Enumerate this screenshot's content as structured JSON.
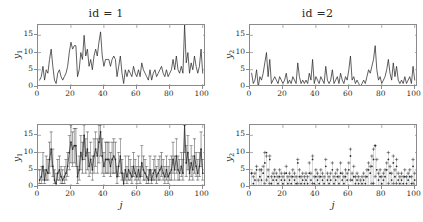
{
  "figure": {
    "width": 423,
    "height": 222,
    "background": "#ffffff",
    "axis_color": "#8a8a8a",
    "line_color": "#2b2b2b",
    "marker_color": "#2b2b2b"
  },
  "chart_data": [
    {
      "id": "top-left",
      "type": "line",
      "title": "id = 1",
      "xlabel": "",
      "ylabel": "y_1",
      "ylabel_base": "y",
      "ylabel_sub": "1",
      "xlim": [
        0,
        102
      ],
      "ylim": [
        0,
        18
      ],
      "xticks": [
        0,
        20,
        40,
        60,
        80,
        100
      ],
      "yticks": [
        0,
        5,
        10,
        15
      ],
      "grid": false,
      "legend": "none",
      "x": [
        1,
        2,
        3,
        4,
        5,
        6,
        7,
        8,
        9,
        10,
        11,
        12,
        13,
        14,
        15,
        16,
        17,
        18,
        19,
        20,
        21,
        22,
        23,
        24,
        25,
        26,
        27,
        28,
        29,
        30,
        31,
        32,
        33,
        34,
        35,
        36,
        37,
        38,
        39,
        40,
        41,
        42,
        43,
        44,
        45,
        46,
        47,
        48,
        49,
        50,
        51,
        52,
        53,
        54,
        55,
        56,
        57,
        58,
        59,
        60,
        61,
        62,
        63,
        64,
        65,
        66,
        67,
        68,
        69,
        70,
        71,
        72,
        73,
        74,
        75,
        76,
        77,
        78,
        79,
        80,
        81,
        82,
        83,
        84,
        85,
        86,
        87,
        88,
        89,
        90,
        91,
        92,
        93,
        94,
        95,
        96,
        97,
        98,
        99,
        100
      ],
      "values": [
        2,
        3,
        6,
        2,
        5,
        4,
        8,
        11,
        6,
        2,
        1,
        4,
        5,
        3,
        2,
        3,
        4,
        6,
        10,
        13,
        11,
        12,
        12,
        3,
        5,
        10,
        8,
        15,
        9,
        11,
        6,
        8,
        5,
        9,
        11,
        9,
        13,
        16,
        9,
        6,
        8,
        8,
        8,
        6,
        8,
        9,
        8,
        3,
        6,
        9,
        4,
        1,
        5,
        3,
        5,
        4,
        3,
        6,
        4,
        3,
        5,
        3,
        7,
        5,
        4,
        3,
        2,
        5,
        2,
        4,
        5,
        3,
        4,
        5,
        6,
        4,
        3,
        5,
        3,
        4,
        5,
        8,
        5,
        9,
        5,
        4,
        6,
        4,
        18,
        7,
        10,
        4,
        7,
        5,
        9,
        6,
        4,
        6,
        11,
        4
      ]
    },
    {
      "id": "top-right",
      "type": "line",
      "title": "id =2",
      "xlabel": "",
      "ylabel": "y_2",
      "ylabel_base": "y",
      "ylabel_sub": "2",
      "xlim": [
        0,
        102
      ],
      "ylim": [
        0,
        18
      ],
      "xticks": [
        0,
        20,
        40,
        60,
        80,
        100
      ],
      "yticks": [
        0,
        5,
        10,
        15
      ],
      "grid": false,
      "legend": "none",
      "x": [
        1,
        2,
        3,
        4,
        5,
        6,
        7,
        8,
        9,
        10,
        11,
        12,
        13,
        14,
        15,
        16,
        17,
        18,
        19,
        20,
        21,
        22,
        23,
        24,
        25,
        26,
        27,
        28,
        29,
        30,
        31,
        32,
        33,
        34,
        35,
        36,
        37,
        38,
        39,
        40,
        41,
        42,
        43,
        44,
        45,
        46,
        47,
        48,
        49,
        50,
        51,
        52,
        53,
        54,
        55,
        56,
        57,
        58,
        59,
        60,
        61,
        62,
        63,
        64,
        65,
        66,
        67,
        68,
        69,
        70,
        71,
        72,
        73,
        74,
        75,
        76,
        77,
        78,
        79,
        80,
        81,
        82,
        83,
        84,
        85,
        86,
        87,
        88,
        89,
        90,
        91,
        92,
        93,
        94,
        95,
        96,
        97,
        98,
        99,
        100
      ],
      "values": [
        4,
        1,
        2,
        5,
        0,
        3,
        2,
        4,
        7,
        10,
        3,
        8,
        1,
        2,
        3,
        2,
        1,
        3,
        2,
        1,
        2,
        4,
        1,
        2,
        1,
        3,
        2,
        1,
        7,
        3,
        1,
        2,
        1,
        2,
        1,
        4,
        2,
        8,
        1,
        3,
        2,
        1,
        3,
        2,
        1,
        6,
        2,
        1,
        2,
        5,
        1,
        2,
        3,
        1,
        4,
        2,
        1,
        3,
        2,
        5,
        9,
        2,
        3,
        1,
        2,
        1,
        0,
        1,
        2,
        1,
        3,
        5,
        4,
        6,
        8,
        12,
        5,
        2,
        3,
        1,
        2,
        3,
        5,
        8,
        4,
        2,
        7,
        3,
        6,
        2,
        1,
        2,
        1,
        3,
        1,
        2,
        3,
        1,
        6,
        2
      ]
    },
    {
      "id": "bottom-left",
      "type": "line",
      "title": "",
      "xlabel": "j",
      "ylabel": "y_1",
      "ylabel_base": "y",
      "ylabel_sub": "1",
      "xlim": [
        0,
        102
      ],
      "ylim": [
        0,
        18
      ],
      "xticks": [
        0,
        20,
        40,
        60,
        80,
        100
      ],
      "yticks": [
        0,
        5,
        10,
        15
      ],
      "grid": false,
      "legend": "none",
      "description": "observed counts with prediction interval whiskers",
      "x": [
        1,
        2,
        3,
        4,
        5,
        6,
        7,
        8,
        9,
        10,
        11,
        12,
        13,
        14,
        15,
        16,
        17,
        18,
        19,
        20,
        21,
        22,
        23,
        24,
        25,
        26,
        27,
        28,
        29,
        30,
        31,
        32,
        33,
        34,
        35,
        36,
        37,
        38,
        39,
        40,
        41,
        42,
        43,
        44,
        45,
        46,
        47,
        48,
        49,
        50,
        51,
        52,
        53,
        54,
        55,
        56,
        57,
        58,
        59,
        60,
        61,
        62,
        63,
        64,
        65,
        66,
        67,
        68,
        69,
        70,
        71,
        72,
        73,
        74,
        75,
        76,
        77,
        78,
        79,
        80,
        81,
        82,
        83,
        84,
        85,
        86,
        87,
        88,
        89,
        90,
        91,
        92,
        93,
        94,
        95,
        96,
        97,
        98,
        99,
        100
      ],
      "values": [
        2,
        3,
        6,
        2,
        5,
        4,
        8,
        11,
        6,
        2,
        1,
        4,
        5,
        3,
        2,
        3,
        4,
        6,
        10,
        13,
        11,
        12,
        12,
        3,
        5,
        10,
        8,
        15,
        9,
        11,
        6,
        8,
        5,
        9,
        11,
        9,
        13,
        16,
        9,
        6,
        8,
        8,
        8,
        6,
        8,
        9,
        8,
        3,
        6,
        9,
        4,
        1,
        5,
        3,
        5,
        4,
        3,
        6,
        4,
        3,
        5,
        3,
        7,
        5,
        4,
        3,
        2,
        5,
        2,
        4,
        5,
        3,
        4,
        5,
        6,
        4,
        3,
        5,
        3,
        4,
        5,
        8,
        5,
        9,
        5,
        4,
        6,
        4,
        18,
        7,
        10,
        4,
        7,
        5,
        9,
        6,
        4,
        6,
        11,
        4
      ],
      "err_lo": [
        1,
        1,
        2,
        1,
        2,
        2,
        4,
        6,
        3,
        1,
        0,
        2,
        2,
        1,
        1,
        1,
        2,
        3,
        5,
        7,
        6,
        7,
        6,
        1,
        2,
        5,
        4,
        8,
        4,
        5,
        3,
        4,
        2,
        4,
        6,
        4,
        7,
        9,
        4,
        3,
        4,
        4,
        4,
        3,
        4,
        4,
        4,
        1,
        3,
        4,
        2,
        0,
        2,
        1,
        2,
        2,
        1,
        3,
        2,
        1,
        2,
        1,
        3,
        2,
        2,
        1,
        1,
        2,
        1,
        2,
        2,
        1,
        2,
        2,
        3,
        2,
        1,
        2,
        1,
        2,
        2,
        4,
        2,
        4,
        2,
        2,
        3,
        2,
        10,
        3,
        5,
        2,
        3,
        2,
        4,
        3,
        2,
        3,
        6,
        2
      ],
      "err_hi": [
        5,
        6,
        10,
        5,
        9,
        8,
        13,
        16,
        11,
        5,
        4,
        8,
        9,
        6,
        5,
        6,
        8,
        10,
        15,
        18,
        16,
        17,
        17,
        6,
        9,
        15,
        13,
        18,
        14,
        16,
        10,
        13,
        9,
        14,
        16,
        14,
        18,
        18,
        14,
        10,
        13,
        13,
        13,
        10,
        13,
        14,
        13,
        6,
        10,
        14,
        8,
        4,
        9,
        6,
        9,
        8,
        6,
        10,
        8,
        6,
        9,
        6,
        12,
        9,
        8,
        6,
        5,
        9,
        5,
        8,
        9,
        6,
        8,
        9,
        10,
        8,
        6,
        9,
        6,
        8,
        9,
        13,
        9,
        14,
        9,
        8,
        10,
        8,
        18,
        12,
        15,
        8,
        12,
        9,
        14,
        10,
        8,
        10,
        16,
        8
      ]
    },
    {
      "id": "bottom-right",
      "type": "scatter",
      "title": "",
      "xlabel": "j",
      "ylabel": "y_2",
      "ylabel_base": "y",
      "ylabel_sub": "2",
      "xlim": [
        0,
        102
      ],
      "ylim": [
        0,
        18
      ],
      "xticks": [
        0,
        20,
        40,
        60,
        80,
        100
      ],
      "yticks": [
        0,
        5,
        10,
        15
      ],
      "grid": false,
      "legend": "none",
      "description": "observed counts as dots with plus-marker prediction interval bounds",
      "x": [
        1,
        2,
        3,
        4,
        5,
        6,
        7,
        8,
        9,
        10,
        11,
        12,
        13,
        14,
        15,
        16,
        17,
        18,
        19,
        20,
        21,
        22,
        23,
        24,
        25,
        26,
        27,
        28,
        29,
        30,
        31,
        32,
        33,
        34,
        35,
        36,
        37,
        38,
        39,
        40,
        41,
        42,
        43,
        44,
        45,
        46,
        47,
        48,
        49,
        50,
        51,
        52,
        53,
        54,
        55,
        56,
        57,
        58,
        59,
        60,
        61,
        62,
        63,
        64,
        65,
        66,
        67,
        68,
        69,
        70,
        71,
        72,
        73,
        74,
        75,
        76,
        77,
        78,
        79,
        80,
        81,
        82,
        83,
        84,
        85,
        86,
        87,
        88,
        89,
        90,
        91,
        92,
        93,
        94,
        95,
        96,
        97,
        98,
        99,
        100
      ],
      "values": [
        4,
        1,
        2,
        5,
        0,
        3,
        2,
        4,
        7,
        10,
        3,
        8,
        1,
        2,
        3,
        2,
        1,
        3,
        2,
        1,
        2,
        4,
        1,
        2,
        1,
        3,
        2,
        1,
        7,
        3,
        1,
        2,
        1,
        2,
        1,
        4,
        2,
        8,
        1,
        3,
        2,
        1,
        3,
        2,
        1,
        6,
        2,
        1,
        2,
        5,
        1,
        2,
        3,
        1,
        4,
        2,
        1,
        3,
        2,
        5,
        9,
        2,
        3,
        1,
        2,
        1,
        0,
        1,
        2,
        1,
        3,
        5,
        4,
        6,
        8,
        12,
        5,
        2,
        3,
        1,
        2,
        3,
        5,
        8,
        4,
        2,
        7,
        3,
        6,
        2,
        1,
        2,
        1,
        3,
        1,
        2,
        3,
        1,
        6,
        2
      ],
      "err_lo": [
        0,
        0,
        0,
        0,
        0,
        0,
        0,
        0,
        1,
        2,
        0,
        1,
        0,
        0,
        0,
        0,
        0,
        0,
        0,
        0,
        0,
        0,
        0,
        0,
        0,
        0,
        0,
        0,
        1,
        0,
        0,
        0,
        0,
        0,
        0,
        0,
        0,
        1,
        0,
        0,
        0,
        0,
        0,
        0,
        0,
        0,
        0,
        0,
        0,
        0,
        0,
        0,
        0,
        0,
        0,
        0,
        0,
        0,
        0,
        0,
        2,
        0,
        0,
        0,
        0,
        0,
        0,
        0,
        0,
        0,
        0,
        0,
        0,
        1,
        1,
        3,
        0,
        0,
        0,
        0,
        0,
        0,
        0,
        1,
        0,
        0,
        1,
        0,
        1,
        0,
        0,
        0,
        0,
        0,
        0,
        0,
        0,
        0,
        1,
        0
      ],
      "err_hi": [
        4,
        3,
        4,
        6,
        2,
        5,
        5,
        6,
        10,
        9,
        5,
        9,
        3,
        4,
        5,
        4,
        3,
        5,
        4,
        3,
        4,
        6,
        3,
        4,
        3,
        5,
        4,
        3,
        8,
        5,
        3,
        4,
        3,
        4,
        3,
        7,
        4,
        9,
        3,
        5,
        4,
        3,
        5,
        4,
        3,
        8,
        4,
        3,
        4,
        7,
        3,
        4,
        5,
        3,
        7,
        4,
        3,
        5,
        4,
        7,
        11,
        4,
        6,
        3,
        4,
        3,
        2,
        3,
        4,
        3,
        5,
        7,
        6,
        9,
        11,
        12,
        8,
        4,
        5,
        3,
        4,
        5,
        7,
        10,
        6,
        4,
        9,
        5,
        8,
        4,
        3,
        4,
        3,
        5,
        3,
        4,
        5,
        3,
        8,
        4
      ]
    }
  ]
}
